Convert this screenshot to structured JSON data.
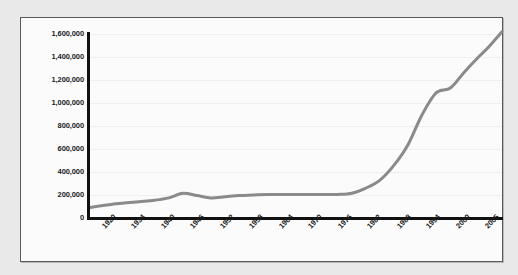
{
  "chart_data": {
    "type": "line",
    "title": "",
    "subtitle": "",
    "xlabel": "",
    "ylabel": "",
    "grid": true,
    "legend": false,
    "legend_position": "none",
    "line_color": "#8a8a8a",
    "axis_color": "#111111",
    "frame_color": "#555a5e",
    "plot_background": "#fbfbfb",
    "page_background": "#e9e9e9",
    "ylim": [
      0,
      1600000
    ],
    "yticks": [
      0,
      200000,
      400000,
      600000,
      800000,
      1000000,
      1200000,
      1400000,
      1600000
    ],
    "ytick_labels": [
      "0",
      "200,000",
      "400,000",
      "600,000",
      "800,000",
      "1,000,000",
      "1,200,000",
      "1,400,000",
      "1,600,000"
    ],
    "xtick_labels": [
      "1920",
      "1934",
      "1940",
      "1946",
      "1952",
      "1958",
      "1964",
      "1970",
      "1976",
      "1982",
      "1988",
      "1994",
      "2000",
      "2005"
    ],
    "xlim": [
      1920,
      2008
    ],
    "series": [
      {
        "name": "series-1",
        "x": [
          1920,
          1925,
          1930,
          1934,
          1937,
          1940,
          1943,
          1946,
          1949,
          1952,
          1955,
          1958,
          1961,
          1964,
          1967,
          1970,
          1973,
          1976,
          1979,
          1982,
          1985,
          1988,
          1991,
          1994,
          1997,
          2000,
          2003,
          2005,
          2008
        ],
        "values": [
          90000,
          120000,
          140000,
          155000,
          175000,
          215000,
          195000,
          175000,
          185000,
          195000,
          200000,
          205000,
          205000,
          205000,
          205000,
          205000,
          205000,
          215000,
          260000,
          330000,
          460000,
          640000,
          900000,
          1090000,
          1130000,
          1270000,
          1400000,
          1480000,
          1620000
        ]
      }
    ]
  }
}
